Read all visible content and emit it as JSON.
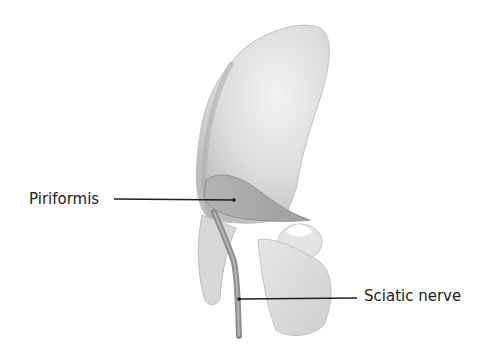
{
  "figure": {
    "title_fragment": "Figure (partially cropped)",
    "labels": [
      {
        "id": "piriformis",
        "text": "Piriformis"
      },
      {
        "id": "sciatic_nerve",
        "text": "Sciatic nerve"
      }
    ]
  },
  "colors": {
    "background": "#ffffff",
    "bone_light": "#ececec",
    "bone_mid": "#d4d4d4",
    "bone_shadow": "#b8b8b8",
    "muscle": "#a9a9a9",
    "nerve": "#8e8e8e",
    "leader_line": "#1f1f1f",
    "label_text": "#222222"
  }
}
